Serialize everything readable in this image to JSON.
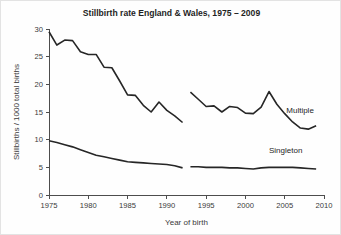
{
  "chart_data": {
    "type": "line",
    "title": "Stillbirth rate England & Wales, 1975 – 2009",
    "xlabel": "Year of birth",
    "ylabel": "Stillbirths / 1000 total births",
    "xlim": [
      1975,
      2010
    ],
    "ylim": [
      0,
      30
    ],
    "xticks": [
      1975,
      1980,
      1985,
      1990,
      1995,
      2000,
      2005,
      2010
    ],
    "xtick_labels": [
      "1975",
      "1980",
      "1985",
      "1990",
      "1995",
      "2000",
      "2005",
      "2010"
    ],
    "yticks": [
      0,
      5,
      10,
      15,
      20,
      25,
      30
    ],
    "ytick_labels": [
      "0",
      "5",
      "10",
      "15",
      "20",
      "25",
      "30"
    ],
    "grid": false,
    "legend_position": "inline-right",
    "series": [
      {
        "name": "Multiple",
        "label": "Multiple",
        "color": "#262626",
        "segments": [
          {
            "x": [
              1975,
              1976,
              1977,
              1978,
              1979,
              1980,
              1981,
              1982,
              1983,
              1984,
              1985,
              1986,
              1987,
              1988,
              1989,
              1990,
              1991,
              1992
            ],
            "y": [
              29.5,
              27.1,
              28.0,
              27.9,
              25.9,
              25.4,
              25.4,
              23.1,
              23.0,
              20.6,
              18.1,
              18.0,
              16.2,
              15.0,
              16.8,
              15.3,
              14.3,
              13.1
            ]
          },
          {
            "x": [
              1993,
              1994,
              1995,
              1996,
              1997,
              1998,
              1999,
              2000,
              2001,
              2002,
              2003,
              2004,
              2005,
              2006,
              2007,
              2008,
              2009
            ],
            "y": [
              18.6,
              17.3,
              16.0,
              16.1,
              15.0,
              16.0,
              15.8,
              14.8,
              14.7,
              15.9,
              18.7,
              16.4,
              14.7,
              13.2,
              12.1,
              11.9,
              12.5
            ]
          }
        ]
      },
      {
        "name": "Singleton",
        "label": "Singleton",
        "color": "#262626",
        "segments": [
          {
            "x": [
              1975,
              1976,
              1977,
              1978,
              1979,
              1980,
              1981,
              1982,
              1983,
              1984,
              1985,
              1986,
              1987,
              1988,
              1989,
              1990,
              1991,
              1992
            ],
            "y": [
              9.8,
              9.5,
              9.1,
              8.7,
              8.2,
              7.7,
              7.2,
              6.9,
              6.6,
              6.3,
              6.0,
              5.9,
              5.8,
              5.7,
              5.6,
              5.5,
              5.3,
              4.9
            ]
          },
          {
            "x": [
              1993,
              1994,
              1995,
              1996,
              1997,
              1998,
              1999,
              2000,
              2001,
              2002,
              2003,
              2004,
              2005,
              2006,
              2007,
              2008,
              2009
            ],
            "y": [
              5.1,
              5.1,
              5.0,
              5.0,
              5.0,
              4.9,
              4.9,
              4.8,
              4.7,
              4.9,
              5.0,
              5.0,
              5.0,
              5.0,
              4.9,
              4.8,
              4.7
            ]
          }
        ]
      }
    ],
    "annotations": [
      {
        "text": "Multiple",
        "x": 2005.2,
        "y": 15.3
      },
      {
        "text": "Singleton",
        "x": 2003.0,
        "y": 8.2
      }
    ]
  }
}
